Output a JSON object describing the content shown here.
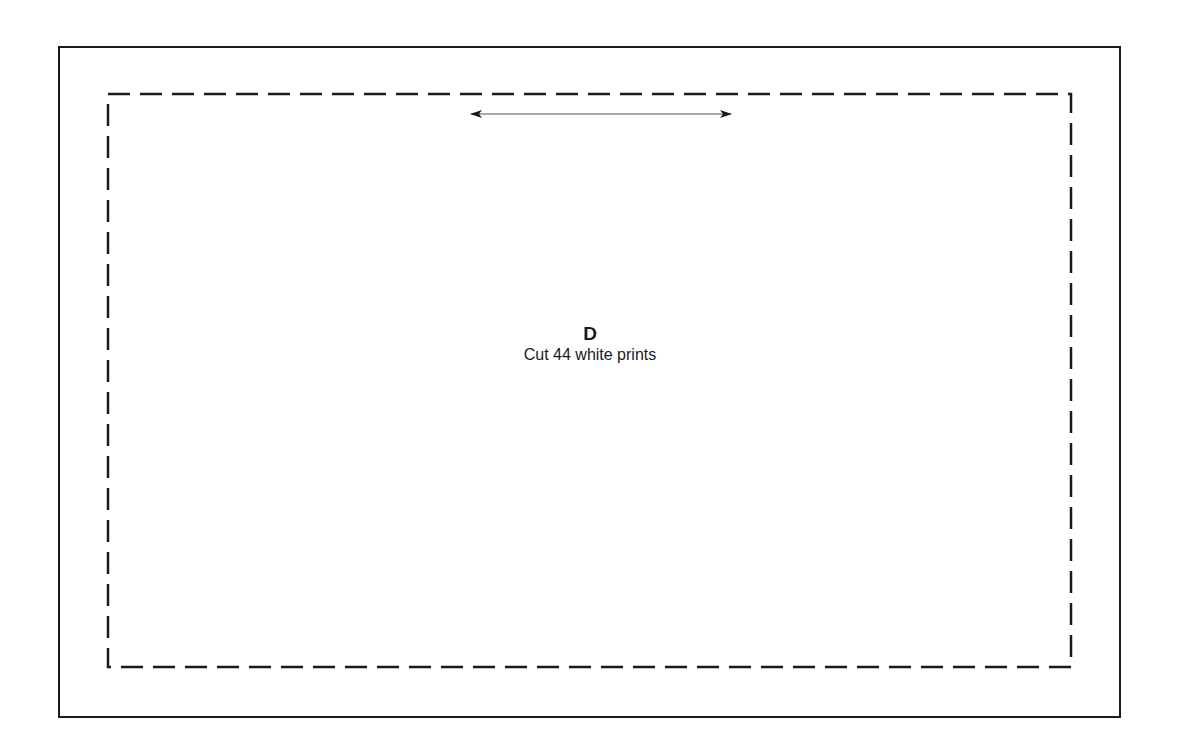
{
  "pattern_piece": {
    "letter": "D",
    "instruction": "Cut 44 white prints"
  },
  "elements": {
    "outer_border": "solid",
    "seam_line": "dashed",
    "grainline": "double-headed-arrow"
  },
  "colors": {
    "line": "#1a1a1a",
    "background": "#ffffff"
  }
}
